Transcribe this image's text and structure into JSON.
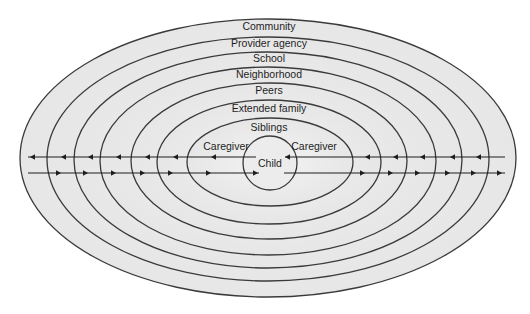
{
  "rings": [
    {
      "label": "Community",
      "cx": 268,
      "cy": 158,
      "rx": 248,
      "ry": 139,
      "label_y": 30
    },
    {
      "label": "Provider agency",
      "cx": 268,
      "cy": 159,
      "rx": 221,
      "ry": 122,
      "label_y": 47
    },
    {
      "label": "School",
      "cx": 268,
      "cy": 160,
      "rx": 194,
      "ry": 108,
      "label_y": 62
    },
    {
      "label": "Neighborhood",
      "cx": 268,
      "cy": 161,
      "rx": 168,
      "ry": 94,
      "label_y": 78
    },
    {
      "label": "Peers",
      "cx": 269,
      "cy": 161,
      "rx": 138,
      "ry": 78,
      "label_y": 94
    },
    {
      "label": "Extended family",
      "cx": 269,
      "cy": 162,
      "rx": 112,
      "ry": 62,
      "label_y": 112
    },
    {
      "label": "Siblings",
      "cx": 270,
      "cy": 162,
      "rx": 83,
      "ry": 44,
      "label_y": 131
    }
  ],
  "inner": {
    "caregiver_left": {
      "label": "Caregiver",
      "x": 226,
      "y": 150
    },
    "caregiver_right": {
      "label": "Caregiver",
      "x": 314,
      "y": 150
    },
    "child": {
      "label": "Child",
      "cx": 270,
      "cy": 163,
      "r": 27,
      "label_y": 167
    }
  },
  "arrows": {
    "top_y": 157,
    "bottom_y": 173,
    "direction_top": "inward-left",
    "direction_bottom": "outward-right",
    "top_left_heads_x": [
      30,
      61,
      88,
      116,
      145,
      173,
      211
    ],
    "top_right_heads_x": [
      285,
      365,
      393,
      420,
      450,
      476
    ],
    "bottom_left_heads_x": [
      61,
      88,
      116,
      145,
      173,
      211,
      258
    ],
    "bottom_right_heads_x": [
      365,
      393,
      420,
      450,
      476,
      502
    ]
  },
  "colors": {
    "background": "#ffffff",
    "ring_fill_outer": "#e6e6e6",
    "ring_fill_inner": "#f2f2f2",
    "stroke": "#3a3a3a",
    "text": "#1e1e1e"
  }
}
